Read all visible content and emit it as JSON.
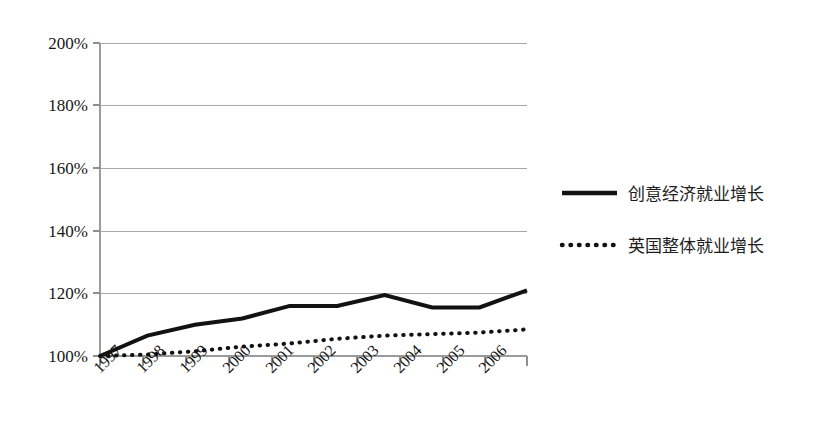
{
  "chart_data": {
    "type": "line",
    "title": "",
    "subtitle": "",
    "xlabel": "",
    "ylabel": "",
    "categories": [
      "1997",
      "1998",
      "1999",
      "2000",
      "2001",
      "2002",
      "2003",
      "2004",
      "2005",
      "2006"
    ],
    "series": [
      {
        "name": "创意经济就业增长",
        "style": "solid",
        "values": [
          100,
          106.5,
          110,
          112,
          116,
          116,
          119.5,
          115.5,
          115.5,
          121
        ]
      },
      {
        "name": "英国整体就业增长",
        "style": "dotted",
        "values": [
          100,
          100.5,
          101.5,
          103,
          104,
          105.5,
          106.5,
          107,
          107.5,
          108.5
        ]
      }
    ],
    "ylim": [
      100,
      200
    ],
    "ytick_values": [
      100,
      120,
      140,
      160,
      180,
      200
    ],
    "ytick_labels": [
      "100%",
      "120%",
      "140%",
      "160%",
      "180%",
      "200%"
    ],
    "xtick_labels": [
      "1997",
      "1998",
      "1999",
      "2000",
      "2001",
      "2002",
      "2003",
      "2004",
      "2005",
      "2006"
    ],
    "xtick_rotation_deg": -45,
    "grid": "horizontal",
    "legend_position": "right",
    "legend_entries": [
      {
        "label": "创意经济就业增长",
        "style": "solid"
      },
      {
        "label": "英国整体就业增长",
        "style": "dotted"
      }
    ],
    "colors": {
      "series_line": "#121212",
      "gridline": "#a9a9a9",
      "axis": "#9b9b9b",
      "background": "#ffffff",
      "text": "#161616"
    }
  }
}
